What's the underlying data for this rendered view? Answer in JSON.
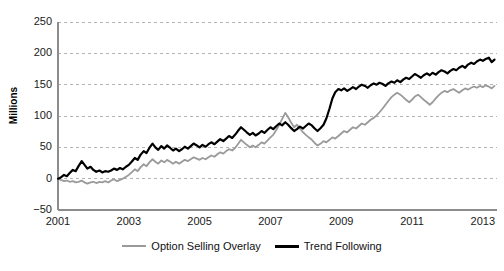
{
  "chart_data": {
    "type": "line",
    "title": "",
    "xlabel": "",
    "ylabel": "Millions",
    "xlim": [
      2001,
      2013.4
    ],
    "ylim": [
      -50,
      250
    ],
    "ytick_labels": [
      "250",
      "200",
      "150",
      "100",
      "50",
      "0",
      "−50"
    ],
    "ytick_values": [
      250,
      200,
      150,
      100,
      50,
      0,
      -50
    ],
    "xtick_labels": [
      "2001",
      "2003",
      "2005",
      "2007",
      "2009",
      "2011",
      "2013"
    ],
    "xtick_values": [
      2001,
      2003,
      2005,
      2007,
      2009,
      2011,
      2013
    ],
    "grid": "horizontal-dashed",
    "legend_position": "bottom-center",
    "colors": {
      "option_selling_overlay": "#9a9a9a",
      "trend_following": "#000000",
      "grid": "#b4b4b4",
      "axis": "#8c8c8c",
      "background": "#ffffff"
    },
    "x": [
      2001.0,
      2001.08,
      2001.17,
      2001.25,
      2001.33,
      2001.42,
      2001.5,
      2001.58,
      2001.67,
      2001.75,
      2001.83,
      2001.92,
      2002.0,
      2002.08,
      2002.17,
      2002.25,
      2002.33,
      2002.42,
      2002.5,
      2002.58,
      2002.67,
      2002.75,
      2002.83,
      2002.92,
      2003.0,
      2003.08,
      2003.17,
      2003.25,
      2003.33,
      2003.42,
      2003.5,
      2003.58,
      2003.67,
      2003.75,
      2003.83,
      2003.92,
      2004.0,
      2004.08,
      2004.17,
      2004.25,
      2004.33,
      2004.42,
      2004.5,
      2004.58,
      2004.67,
      2004.75,
      2004.83,
      2004.92,
      2005.0,
      2005.08,
      2005.17,
      2005.25,
      2005.33,
      2005.42,
      2005.5,
      2005.58,
      2005.67,
      2005.75,
      2005.83,
      2005.92,
      2006.0,
      2006.08,
      2006.17,
      2006.25,
      2006.33,
      2006.42,
      2006.5,
      2006.58,
      2006.67,
      2006.75,
      2006.83,
      2006.92,
      2007.0,
      2007.08,
      2007.17,
      2007.25,
      2007.33,
      2007.42,
      2007.5,
      2007.58,
      2007.67,
      2007.75,
      2007.83,
      2007.92,
      2008.0,
      2008.08,
      2008.17,
      2008.25,
      2008.33,
      2008.42,
      2008.5,
      2008.58,
      2008.67,
      2008.75,
      2008.83,
      2008.92,
      2009.0,
      2009.08,
      2009.17,
      2009.25,
      2009.33,
      2009.42,
      2009.5,
      2009.58,
      2009.67,
      2009.75,
      2009.83,
      2009.92,
      2010.0,
      2010.08,
      2010.17,
      2010.25,
      2010.33,
      2010.42,
      2010.5,
      2010.58,
      2010.67,
      2010.75,
      2010.83,
      2010.92,
      2011.0,
      2011.08,
      2011.17,
      2011.25,
      2011.33,
      2011.42,
      2011.5,
      2011.58,
      2011.67,
      2011.75,
      2011.83,
      2011.92,
      2012.0,
      2012.08,
      2012.17,
      2012.25,
      2012.33,
      2012.42,
      2012.5,
      2012.58,
      2012.67,
      2012.75,
      2012.83,
      2012.92,
      2013.0,
      2013.08,
      2013.17,
      2013.25,
      2013.33
    ],
    "series": [
      {
        "name": "Trend Following",
        "color": "#000000",
        "width": 2.2,
        "values": [
          0,
          2,
          6,
          4,
          9,
          14,
          12,
          20,
          28,
          22,
          16,
          19,
          14,
          11,
          13,
          10,
          12,
          11,
          13,
          16,
          14,
          17,
          15,
          19,
          22,
          27,
          33,
          30,
          38,
          44,
          41,
          49,
          56,
          50,
          46,
          52,
          48,
          53,
          49,
          45,
          48,
          44,
          47,
          51,
          48,
          52,
          56,
          53,
          50,
          54,
          51,
          55,
          58,
          55,
          59,
          63,
          60,
          64,
          68,
          65,
          70,
          76,
          82,
          78,
          74,
          70,
          73,
          69,
          72,
          76,
          73,
          78,
          82,
          79,
          84,
          88,
          85,
          90,
          86,
          81,
          76,
          79,
          83,
          80,
          84,
          88,
          85,
          80,
          76,
          81,
          86,
          96,
          112,
          128,
          138,
          143,
          141,
          144,
          140,
          143,
          146,
          143,
          147,
          150,
          148,
          145,
          149,
          152,
          150,
          153,
          151,
          148,
          152,
          155,
          153,
          157,
          154,
          158,
          161,
          159,
          163,
          167,
          164,
          161,
          165,
          168,
          165,
          169,
          166,
          170,
          173,
          171,
          168,
          172,
          175,
          173,
          177,
          180,
          177,
          182,
          185,
          183,
          187,
          190,
          188,
          191,
          193,
          186,
          190
        ]
      },
      {
        "name": "Option Selling Overlay",
        "color": "#9a9a9a",
        "width": 1.8,
        "values": [
          0,
          -2,
          -4,
          -3,
          -5,
          -4,
          -6,
          -5,
          -3,
          -6,
          -8,
          -6,
          -5,
          -7,
          -5,
          -6,
          -4,
          -6,
          -3,
          -1,
          -4,
          -2,
          0,
          3,
          6,
          10,
          15,
          12,
          18,
          23,
          20,
          26,
          31,
          27,
          24,
          29,
          26,
          30,
          27,
          24,
          27,
          24,
          27,
          30,
          28,
          31,
          34,
          32,
          30,
          33,
          31,
          34,
          37,
          35,
          39,
          42,
          40,
          44,
          47,
          45,
          49,
          55,
          62,
          58,
          54,
          50,
          53,
          50,
          54,
          58,
          56,
          61,
          66,
          70,
          78,
          86,
          95,
          105,
          98,
          90,
          82,
          86,
          80,
          74,
          70,
          66,
          62,
          57,
          53,
          56,
          60,
          58,
          62,
          66,
          64,
          68,
          72,
          76,
          74,
          78,
          82,
          80,
          84,
          88,
          86,
          90,
          94,
          97,
          101,
          106,
          112,
          118,
          124,
          130,
          134,
          137,
          134,
          130,
          126,
          122,
          126,
          131,
          134,
          130,
          126,
          122,
          118,
          122,
          128,
          133,
          137,
          140,
          138,
          141,
          143,
          140,
          137,
          141,
          144,
          142,
          145,
          147,
          145,
          148,
          146,
          149,
          147,
          144,
          148
        ]
      }
    ]
  },
  "axis": {
    "ylabel": "Millions"
  },
  "legend": {
    "items": [
      {
        "label": "Option Selling Overlay",
        "style": "gray"
      },
      {
        "label": "Trend Following",
        "style": "black"
      }
    ]
  }
}
